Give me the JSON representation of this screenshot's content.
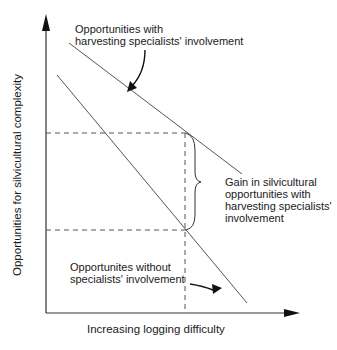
{
  "diagram": {
    "y_axis_label": "Opportunities for silvicultural complexity",
    "x_axis_label": "Increasing logging difficulty",
    "upper_line_label": {
      "line1": "Opportunities with",
      "line2": "harvesting specialists' involvement"
    },
    "lower_line_label": {
      "line1": "Opportunites without",
      "line2": "specialists' involvement"
    },
    "gain_label": {
      "line1": "Gain in silvicultural",
      "line2": "opportunities with",
      "line3": "harvesting specialists'",
      "line4": "involvement"
    },
    "colors": {
      "line": "#555555",
      "axis": "#333333",
      "arrow": "#111111",
      "text": "#1a1a1a"
    }
  }
}
